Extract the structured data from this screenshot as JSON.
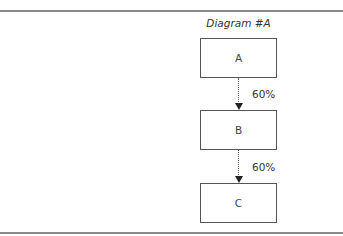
{
  "diagram": {
    "title": "Diagram #A",
    "nodes": [
      {
        "id": "A",
        "label": "A"
      },
      {
        "id": "B",
        "label": "B"
      },
      {
        "id": "C",
        "label": "C"
      }
    ],
    "edges": [
      {
        "from": "A",
        "to": "B",
        "label": "60%",
        "style": "dotted"
      },
      {
        "from": "B",
        "to": "C",
        "label": "60%",
        "style": "dotted"
      }
    ]
  }
}
